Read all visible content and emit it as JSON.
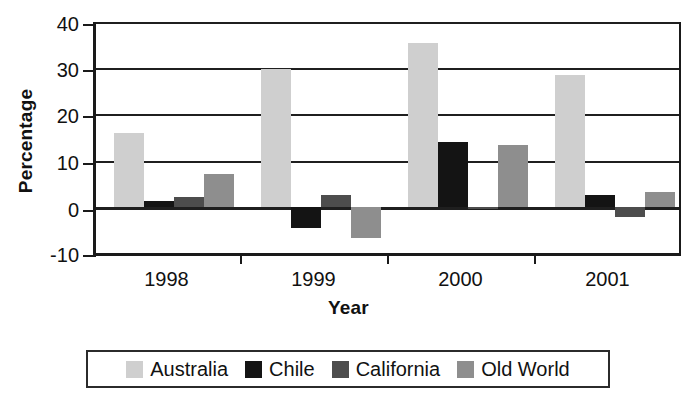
{
  "chart_data": {
    "type": "bar",
    "title": "",
    "xlabel": "Year",
    "ylabel": "Percentage",
    "categories": [
      "1998",
      "1999",
      "2000",
      "2001"
    ],
    "series": [
      {
        "name": "Australia",
        "color": "#cfcfcf",
        "values": [
          16.0,
          29.8,
          35.5,
          28.5
        ]
      },
      {
        "name": "Chile",
        "color": "#141414",
        "values": [
          1.3,
          -4.5,
          14.0,
          2.6
        ]
      },
      {
        "name": "California",
        "color": "#4d4d4d",
        "values": [
          2.2,
          2.6,
          -0.2,
          -2.2
        ]
      },
      {
        "name": "Old World",
        "color": "#8e8e8e",
        "values": [
          7.0,
          -6.7,
          13.4,
          3.2
        ]
      }
    ],
    "ylim": [
      -10,
      40
    ],
    "ytick_values": [
      40,
      30,
      20,
      10,
      0,
      -10
    ],
    "ytick_labels": [
      "40",
      "30",
      "20",
      "10",
      "0",
      "-10"
    ],
    "grid": true,
    "legend_position": "bottom"
  },
  "legend": {
    "entries": [
      {
        "label": "Australia"
      },
      {
        "label": "Chile"
      },
      {
        "label": "California"
      },
      {
        "label": "Old World"
      }
    ]
  }
}
